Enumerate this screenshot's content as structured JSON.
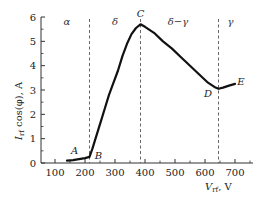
{
  "chart_data": {
    "type": "line",
    "title": "",
    "xlabel": "V_rf, V",
    "ylabel": "I_rf cos(φ), A",
    "xlim": [
      60,
      760
    ],
    "ylim": [
      0,
      6
    ],
    "grid": false,
    "x_ticks": [
      100,
      200,
      300,
      400,
      500,
      600,
      700
    ],
    "y_ticks": [
      0,
      1,
      2,
      3,
      4,
      5,
      6
    ],
    "series": [
      {
        "name": "I_rf cos(φ)",
        "x": [
          140,
          160,
          180,
          200,
          215,
          225,
          235,
          250,
          265,
          280,
          295,
          310,
          325,
          340,
          355,
          370,
          385,
          400,
          430,
          460,
          490,
          520,
          550,
          580,
          610,
          635,
          645,
          660,
          680,
          700
        ],
        "y": [
          0.1,
          0.12,
          0.16,
          0.2,
          0.25,
          0.6,
          1.0,
          1.6,
          2.2,
          2.8,
          3.3,
          3.8,
          4.4,
          4.9,
          5.3,
          5.55,
          5.7,
          5.6,
          5.35,
          5.0,
          4.7,
          4.35,
          4.0,
          3.65,
          3.3,
          3.1,
          3.05,
          3.1,
          3.18,
          3.25
        ]
      }
    ],
    "vertical_dashed_lines": [
      215,
      385,
      645
    ],
    "regions": [
      {
        "label": "α",
        "x": 140
      },
      {
        "label": "δ",
        "x": 300
      },
      {
        "label": "δ−γ",
        "x": 510
      },
      {
        "label": "γ",
        "x": 685
      }
    ],
    "annotations": [
      {
        "label": "A",
        "x": 165,
        "y": 0.35
      },
      {
        "label": "B",
        "x": 245,
        "y": 0.15
      },
      {
        "label": "C",
        "x": 385,
        "y": 6.0
      },
      {
        "label": "D",
        "x": 610,
        "y": 2.7
      },
      {
        "label": "E",
        "x": 720,
        "y": 3.2
      }
    ]
  },
  "labels": {
    "x_axis": "V",
    "x_axis_sub": "rf",
    "x_axis_unit": ", V",
    "y_axis": "I",
    "y_axis_sub": "rf",
    "y_axis_rest": " cos(φ), A"
  }
}
